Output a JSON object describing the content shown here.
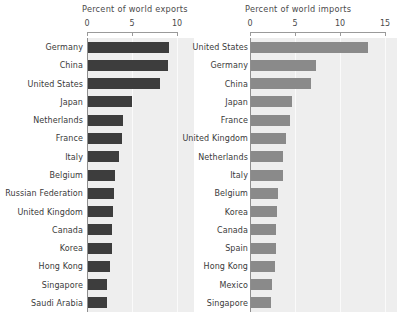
{
  "figure": {
    "width": 401,
    "height": 324,
    "background": "#ffffff",
    "plot_background": "#eeeeee"
  },
  "chart_data": [
    {
      "type": "bar",
      "orientation": "horizontal",
      "title": "Percent of world exports",
      "xlabel": "",
      "ylabel": "",
      "xlim": [
        0,
        10
      ],
      "xticks": [
        0,
        5,
        10
      ],
      "xticklabels": [
        "0",
        "5",
        "10"
      ],
      "grid": true,
      "legend": "none",
      "bar_color": "#3d3d3d",
      "categories": [
        "Germany",
        "China",
        "United States",
        "Japan",
        "Netherlands",
        "France",
        "Italy",
        "Belgium",
        "Russian Federation",
        "United Kingdom",
        "Canada",
        "Korea",
        "Hong Kong",
        "Singapore",
        "Saudi Arabia"
      ],
      "values": [
        9.0,
        8.9,
        8.0,
        4.9,
        3.9,
        3.8,
        3.4,
        3.0,
        2.9,
        2.8,
        2.7,
        2.7,
        2.4,
        2.1,
        2.1
      ]
    },
    {
      "type": "bar",
      "orientation": "horizontal",
      "title": "Percent of world imports",
      "xlabel": "",
      "ylabel": "",
      "xlim": [
        0,
        15
      ],
      "xticks": [
        0,
        5,
        10,
        15
      ],
      "xticklabels": [
        "0",
        "5",
        "10",
        "15"
      ],
      "grid": true,
      "legend": "none",
      "bar_color": "#8a8a8a",
      "categories": [
        "United States",
        "Germany",
        "China",
        "Japan",
        "France",
        "United Kingdom",
        "Netherlands",
        "Italy",
        "Belgium",
        "Korea",
        "Canada",
        "Spain",
        "Hong Kong",
        "Mexico",
        "Singapore"
      ],
      "values": [
        13.0,
        7.2,
        6.7,
        4.6,
        4.3,
        3.9,
        3.6,
        3.5,
        3.0,
        2.9,
        2.8,
        2.8,
        2.7,
        2.3,
        2.2
      ]
    }
  ]
}
